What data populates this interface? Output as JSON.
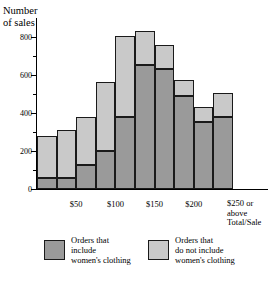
{
  "chart_data": {
    "type": "bar",
    "stacked": true,
    "title": "",
    "ylabel": "Number of sales",
    "xlabel": "Total/Sale",
    "ylim": [
      0,
      900
    ],
    "yticks": [
      0,
      200,
      400,
      600,
      800
    ],
    "ytick_labels": [
      "0",
      "200",
      "400",
      "600",
      "800"
    ],
    "minor_ytick_step": 100,
    "grid": false,
    "legend_position": "bottom",
    "xtick_labels": [
      "$50",
      "$100",
      "$150",
      "$200",
      "$250 or"
    ],
    "xlabel_extra_lines": [
      "above",
      "Total/Sale"
    ],
    "categories": [
      "0-25",
      "25-50",
      "50-75",
      "75-100",
      "100-125",
      "125-150",
      "150-175",
      "175-200",
      "200-225",
      "225-250+"
    ],
    "series": [
      {
        "name": "Orders that include women's clothing",
        "color": "#9a9a9a",
        "values": [
          60,
          60,
          125,
          200,
          380,
          655,
          630,
          490,
          355,
          380
        ]
      },
      {
        "name": "Orders that do not include women's clothing",
        "color": "#c9c9c9",
        "values": [
          220,
          250,
          255,
          365,
          425,
          175,
          130,
          85,
          75,
          125
        ]
      }
    ],
    "totals": [
      280,
      310,
      380,
      565,
      805,
      830,
      760,
      575,
      430,
      505
    ]
  },
  "legend": {
    "items": [
      {
        "swatch": "dark",
        "lines": [
          "Orders that",
          "include",
          "women's clothing"
        ]
      },
      {
        "swatch": "light",
        "lines": [
          "Orders that",
          "do not include",
          "women's clothing"
        ]
      }
    ]
  },
  "axis": {
    "y_title_line1": "Number",
    "y_title_line2": "of sales"
  }
}
